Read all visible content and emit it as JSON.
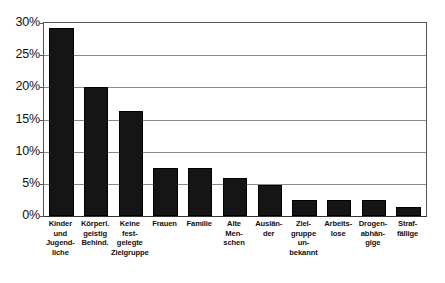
{
  "chart_data": {
    "type": "bar",
    "title": "",
    "subtitle": "",
    "xlabel": "",
    "ylabel": "",
    "ylim": [
      0,
      30
    ],
    "y_tick_labels": [
      "0%",
      "5%",
      "10%",
      "15%",
      "20%",
      "25%",
      "30%"
    ],
    "y_tick_values": [
      0,
      5,
      10,
      15,
      20,
      25,
      30
    ],
    "grid": true,
    "legend": null,
    "legend_position": "none",
    "bar_color": "#151515",
    "axis_color": "#555555",
    "grid_color": "#8a8a8a",
    "categories": [
      "Kinder und Jugendliche",
      "Körperl. geistig Behind.",
      "Keine festgelegte Zielgruppe",
      "Frauen",
      "Familie",
      "Alte Menschen",
      "Ausländer",
      "Zielgruppe unbekannt",
      "Arbeitslose",
      "Drogenabhängige",
      "Straffällige"
    ],
    "category_label_lines": [
      [
        "Kinder",
        "und",
        "Jugend-",
        "liche"
      ],
      [
        "Körperl.",
        "geistig",
        "Behind."
      ],
      [
        "Keine",
        "fest-",
        "gelegte",
        "Zielgruppe"
      ],
      [
        "Frauen"
      ],
      [
        "Familie"
      ],
      [
        "Alte",
        "Men-",
        "schen"
      ],
      [
        "Auslän-",
        "der"
      ],
      [
        "Ziel-",
        "gruppe",
        "un-",
        "bekannt"
      ],
      [
        "Arbeits-",
        "lose"
      ],
      [
        "Drogen-",
        "abhän-",
        "gige"
      ],
      [
        "Straf-",
        "fällige"
      ]
    ],
    "values": [
      29.3,
      20.0,
      16.3,
      7.5,
      7.5,
      5.9,
      4.8,
      2.5,
      2.5,
      2.5,
      1.4
    ]
  }
}
